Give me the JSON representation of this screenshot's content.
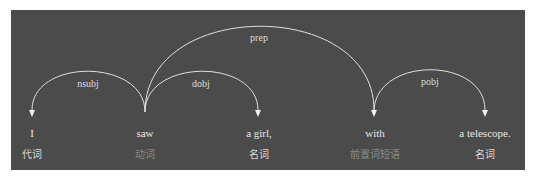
{
  "diagram": {
    "type": "dependency-parse",
    "background": "#4b4b4b",
    "tokens": [
      {
        "text": "I",
        "pos": "代词",
        "pos_color": "#d9d9d9"
      },
      {
        "text": "saw",
        "pos": "动词",
        "pos_color": "#8a8a8a"
      },
      {
        "text": "a girl,",
        "pos": "名词",
        "pos_color": "#d9d9d9"
      },
      {
        "text": "with",
        "pos": "前置词短语",
        "pos_color": "#8a8a8a"
      },
      {
        "text": "a telescope.",
        "pos": "名词",
        "pos_color": "#d9d9d9"
      }
    ],
    "arcs": [
      {
        "label": "nsubj",
        "from": "saw",
        "to": "I"
      },
      {
        "label": "dobj",
        "from": "saw",
        "to": "a girl,"
      },
      {
        "label": "prep",
        "from": "saw",
        "to": "with"
      },
      {
        "label": "pobj",
        "from": "with",
        "to": "a telescope."
      }
    ]
  }
}
